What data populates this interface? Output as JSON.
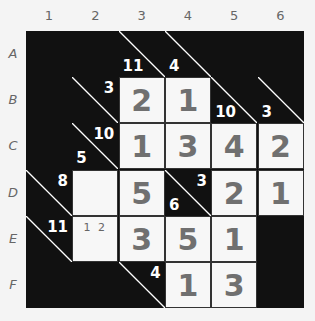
{
  "puzzle": {
    "type": "kakuro",
    "columns": [
      "1",
      "2",
      "3",
      "4",
      "5",
      "6"
    ],
    "rows": [
      "A",
      "B",
      "C",
      "D",
      "E",
      "F"
    ],
    "colors": {
      "black": "#111111",
      "white": "#f7f7f7",
      "digit": "#707070",
      "clue": "#ffffff",
      "label": "#666666"
    },
    "cells": {
      "A3": {
        "kind": "clue",
        "down": "11"
      },
      "A4": {
        "kind": "clue",
        "down": "4"
      },
      "B2": {
        "kind": "clue",
        "across": "3"
      },
      "B3": {
        "kind": "entry",
        "value": "2"
      },
      "B4": {
        "kind": "entry",
        "value": "1"
      },
      "B5": {
        "kind": "clue",
        "down": "10"
      },
      "B6": {
        "kind": "clue",
        "down": "3"
      },
      "C2": {
        "kind": "clue",
        "across": "10",
        "down": "5"
      },
      "C3": {
        "kind": "entry",
        "value": "1"
      },
      "C4": {
        "kind": "entry",
        "value": "3"
      },
      "C5": {
        "kind": "entry",
        "value": "4"
      },
      "C6": {
        "kind": "entry",
        "value": "2"
      },
      "D1": {
        "kind": "clue",
        "across": "8"
      },
      "D2": {
        "kind": "entry",
        "value": ""
      },
      "D3": {
        "kind": "entry",
        "value": "5"
      },
      "D4": {
        "kind": "clue",
        "across": "3",
        "down": "6"
      },
      "D5": {
        "kind": "entry",
        "value": "2"
      },
      "D6": {
        "kind": "entry",
        "value": "1"
      },
      "E1": {
        "kind": "clue",
        "across": "11"
      },
      "E2": {
        "kind": "entry",
        "value": "",
        "pencil": "1 2"
      },
      "E3": {
        "kind": "entry",
        "value": "3"
      },
      "E4": {
        "kind": "entry",
        "value": "5"
      },
      "E5": {
        "kind": "entry",
        "value": "1"
      },
      "F3": {
        "kind": "clue",
        "across": "4"
      },
      "F4": {
        "kind": "entry",
        "value": "1"
      },
      "F5": {
        "kind": "entry",
        "value": "3"
      }
    }
  }
}
